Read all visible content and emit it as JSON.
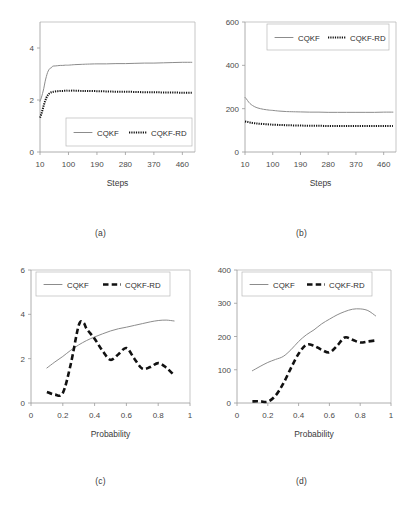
{
  "figure": {
    "background": "#ffffff",
    "series_colors": {
      "cqkf": "#8c8c8c",
      "cqkf_rd": "#111111"
    },
    "panels": [
      {
        "id": "a",
        "caption": "(a)"
      },
      {
        "id": "b",
        "caption": "(b)"
      },
      {
        "id": "c",
        "caption": "(c)"
      },
      {
        "id": "d",
        "caption": "(d)"
      }
    ]
  },
  "chart_data": [
    {
      "panel": "a",
      "type": "line",
      "title": "",
      "xlabel": "Steps",
      "ylabel": "",
      "xlim": [
        10,
        500
      ],
      "ylim": [
        0,
        5
      ],
      "xticks": [
        "10",
        "100",
        "190",
        "280",
        "370",
        "460"
      ],
      "xtick_values": [
        10,
        100,
        190,
        280,
        370,
        460
      ],
      "yticks": [
        "0",
        "2",
        "4"
      ],
      "ytick_values": [
        0,
        2,
        4
      ],
      "grid": false,
      "legend_position": "lower-right",
      "legend": [
        "CQKF",
        "CQKF-RD"
      ],
      "series": [
        {
          "name": "CQKF",
          "style": "solid",
          "color": "#8c8c8c",
          "x": [
            10,
            14,
            18,
            22,
            26,
            30,
            34,
            38,
            42,
            46,
            50,
            58,
            66,
            74,
            82,
            90,
            100,
            120,
            140,
            160,
            190,
            220,
            250,
            280,
            310,
            340,
            370,
            400,
            430,
            460,
            490
          ],
          "y": [
            1.95,
            2.08,
            2.25,
            2.45,
            2.7,
            2.9,
            3.06,
            3.16,
            3.22,
            3.24,
            3.3,
            3.31,
            3.32,
            3.33,
            3.33,
            3.34,
            3.34,
            3.36,
            3.37,
            3.38,
            3.39,
            3.39,
            3.4,
            3.4,
            3.41,
            3.42,
            3.42,
            3.43,
            3.44,
            3.45,
            3.45
          ]
        },
        {
          "name": "CQKF-RD",
          "style": "dotted",
          "color": "#111111",
          "x": [
            10,
            14,
            18,
            22,
            26,
            30,
            34,
            38,
            42,
            46,
            50,
            58,
            66,
            74,
            82,
            90,
            100,
            120,
            140,
            160,
            190,
            220,
            250,
            280,
            310,
            340,
            370,
            400,
            430,
            460,
            490
          ],
          "y": [
            1.32,
            1.45,
            1.62,
            1.8,
            1.95,
            2.08,
            2.17,
            2.23,
            2.27,
            2.3,
            2.31,
            2.33,
            2.34,
            2.35,
            2.35,
            2.36,
            2.36,
            2.36,
            2.35,
            2.35,
            2.34,
            2.33,
            2.32,
            2.32,
            2.31,
            2.3,
            2.3,
            2.29,
            2.29,
            2.28,
            2.28
          ]
        }
      ]
    },
    {
      "panel": "b",
      "type": "line",
      "title": "",
      "xlabel": "Steps",
      "ylabel": "",
      "xlim": [
        10,
        500
      ],
      "ylim": [
        0,
        600
      ],
      "xticks": [
        "10",
        "100",
        "190",
        "280",
        "370",
        "460"
      ],
      "xtick_values": [
        10,
        100,
        190,
        280,
        370,
        460
      ],
      "yticks": [
        "0",
        "200",
        "400",
        "600"
      ],
      "ytick_values": [
        0,
        200,
        400,
        600
      ],
      "grid": false,
      "legend_position": "upper-center",
      "legend": [
        "CQKF",
        "CQKF-RD"
      ],
      "series": [
        {
          "name": "CQKF",
          "style": "solid",
          "color": "#8c8c8c",
          "x": [
            10,
            14,
            18,
            22,
            26,
            30,
            34,
            40,
            46,
            52,
            60,
            70,
            80,
            90,
            100,
            120,
            140,
            160,
            190,
            220,
            250,
            280,
            310,
            340,
            370,
            400,
            430,
            460,
            490
          ],
          "y": [
            252,
            246,
            238,
            230,
            224,
            219,
            215,
            210,
            206,
            203,
            200,
            197,
            195,
            193,
            192,
            189,
            187,
            186,
            185,
            184,
            184,
            183,
            183,
            183,
            183,
            183,
            183,
            184,
            184
          ]
        },
        {
          "name": "CQKF-RD",
          "style": "dotted",
          "color": "#111111",
          "x": [
            10,
            14,
            18,
            22,
            26,
            30,
            34,
            40,
            46,
            52,
            60,
            70,
            80,
            90,
            100,
            120,
            140,
            160,
            190,
            220,
            250,
            280,
            310,
            340,
            370,
            400,
            430,
            460,
            490
          ],
          "y": [
            141,
            140,
            139,
            137,
            136,
            135,
            134,
            133,
            132,
            131,
            130,
            129,
            128,
            127,
            126,
            125,
            124,
            123,
            122,
            121,
            121,
            120,
            120,
            120,
            120,
            120,
            120,
            120,
            120
          ]
        }
      ]
    },
    {
      "panel": "c",
      "type": "line",
      "title": "",
      "xlabel": "Probability",
      "ylabel": "",
      "xlim": [
        0,
        1
      ],
      "ylim": [
        0,
        6
      ],
      "xticks": [
        "0",
        "0.2",
        "0.4",
        "0.6",
        "0.8",
        "1"
      ],
      "xtick_values": [
        0,
        0.2,
        0.4,
        0.6,
        0.8,
        1
      ],
      "yticks": [
        "0",
        "2",
        "4",
        "6"
      ],
      "ytick_values": [
        0,
        2,
        4,
        6
      ],
      "grid": false,
      "legend_position": "upper-left",
      "legend": [
        "CQKF",
        "CQKF-RD"
      ],
      "series": [
        {
          "name": "CQKF",
          "style": "solid",
          "color": "#8c8c8c",
          "x": [
            0.1,
            0.15,
            0.2,
            0.25,
            0.3,
            0.35,
            0.4,
            0.45,
            0.5,
            0.55,
            0.6,
            0.65,
            0.7,
            0.75,
            0.8,
            0.85,
            0.9
          ],
          "y": [
            1.58,
            1.85,
            2.1,
            2.38,
            2.62,
            2.82,
            2.98,
            3.12,
            3.25,
            3.35,
            3.42,
            3.5,
            3.58,
            3.66,
            3.72,
            3.74,
            3.7
          ]
        },
        {
          "name": "CQKF-RD",
          "style": "dashed",
          "color": "#111111",
          "x": [
            0.1,
            0.15,
            0.2,
            0.25,
            0.3,
            0.33,
            0.35,
            0.4,
            0.45,
            0.5,
            0.55,
            0.6,
            0.65,
            0.7,
            0.75,
            0.8,
            0.85,
            0.9
          ],
          "y": [
            0.5,
            0.38,
            0.45,
            1.75,
            3.5,
            3.62,
            3.35,
            2.9,
            2.35,
            1.95,
            2.2,
            2.48,
            2.0,
            1.55,
            1.62,
            1.8,
            1.6,
            1.25
          ]
        }
      ]
    },
    {
      "panel": "d",
      "type": "line",
      "title": "",
      "xlabel": "Probability",
      "ylabel": "",
      "xlim": [
        0,
        1
      ],
      "ylim": [
        0,
        400
      ],
      "xticks": [
        "0",
        "0.2",
        "0.4",
        "0.6",
        "0.8",
        "1"
      ],
      "xtick_values": [
        0,
        0.2,
        0.4,
        0.6,
        0.8,
        1
      ],
      "yticks": [
        "0",
        "100",
        "200",
        "300",
        "400"
      ],
      "ytick_values": [
        0,
        100,
        200,
        300,
        400
      ],
      "grid": false,
      "legend_position": "upper-left",
      "legend": [
        "CQKF",
        "CQKF-RD"
      ],
      "series": [
        {
          "name": "CQKF",
          "style": "solid",
          "color": "#8c8c8c",
          "x": [
            0.1,
            0.15,
            0.2,
            0.25,
            0.3,
            0.35,
            0.4,
            0.45,
            0.5,
            0.55,
            0.6,
            0.65,
            0.7,
            0.75,
            0.8,
            0.85,
            0.9
          ],
          "y": [
            97,
            110,
            122,
            131,
            140,
            160,
            185,
            205,
            220,
            238,
            252,
            265,
            275,
            282,
            283,
            278,
            262
          ]
        },
        {
          "name": "CQKF-RD",
          "style": "dashed",
          "color": "#111111",
          "x": [
            0.1,
            0.15,
            0.2,
            0.25,
            0.3,
            0.35,
            0.4,
            0.45,
            0.5,
            0.55,
            0.6,
            0.65,
            0.7,
            0.75,
            0.8,
            0.85,
            0.9
          ],
          "y": [
            5,
            5,
            4,
            22,
            58,
            105,
            148,
            175,
            172,
            160,
            152,
            172,
            197,
            190,
            182,
            185,
            188
          ]
        }
      ]
    }
  ]
}
